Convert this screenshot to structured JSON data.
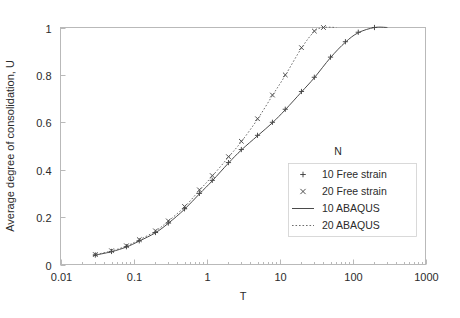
{
  "chart_data": {
    "type": "line",
    "title": "",
    "xlabel": "T",
    "ylabel": "Average degree of consolidation, U",
    "xscale": "log",
    "xlim": [
      0.01,
      1000
    ],
    "ylim": [
      0,
      1
    ],
    "xticks": [
      "0.01",
      "0.1",
      "1",
      "10",
      "100",
      "1000"
    ],
    "xtick_values": [
      0.01,
      0.1,
      1,
      10,
      100,
      1000
    ],
    "yticks": [
      "0",
      "0.2",
      "0.4",
      "0.6",
      "0.8",
      "1"
    ],
    "ytick_values": [
      0,
      0.2,
      0.4,
      0.6,
      0.8,
      1
    ],
    "grid": false,
    "y_inverted": false,
    "legend_position": "inside-right",
    "legend_title": "N",
    "series": [
      {
        "name": "10 Free strain",
        "marker": "plus",
        "line": "none",
        "color": "#3a3a3a",
        "x": [
          0.03,
          0.05,
          0.08,
          0.12,
          0.2,
          0.3,
          0.5,
          0.8,
          1.2,
          2.0,
          3.0,
          5.0,
          8.0,
          12.0,
          20.0,
          30.0,
          50.0,
          80.0,
          120.0,
          200.0
        ],
        "y": [
          0.04,
          0.055,
          0.075,
          0.1,
          0.135,
          0.175,
          0.235,
          0.3,
          0.355,
          0.43,
          0.485,
          0.545,
          0.6,
          0.655,
          0.73,
          0.79,
          0.875,
          0.94,
          0.98,
          1.0
        ]
      },
      {
        "name": "20 Free strain",
        "marker": "cross",
        "line": "none",
        "color": "#3a3a3a",
        "x": [
          0.03,
          0.05,
          0.08,
          0.12,
          0.2,
          0.3,
          0.5,
          0.8,
          1.2,
          2.0,
          3.0,
          5.0,
          8.0,
          12.0,
          20.0,
          30.0,
          40.0
        ],
        "y": [
          0.042,
          0.058,
          0.079,
          0.105,
          0.142,
          0.184,
          0.245,
          0.315,
          0.375,
          0.455,
          0.52,
          0.615,
          0.715,
          0.8,
          0.915,
          0.985,
          1.0
        ]
      },
      {
        "name": "10 ABAQUS",
        "marker": "none",
        "line": "solid",
        "color": "#4a4a4a",
        "x": [
          0.028,
          0.05,
          0.08,
          0.12,
          0.2,
          0.3,
          0.5,
          0.8,
          1.2,
          2.0,
          3.0,
          5.0,
          8.0,
          12.0,
          20.0,
          30.0,
          50.0,
          80.0,
          120.0,
          200.0,
          300.0
        ],
        "y": [
          0.038,
          0.054,
          0.074,
          0.099,
          0.134,
          0.174,
          0.233,
          0.298,
          0.353,
          0.428,
          0.483,
          0.543,
          0.598,
          0.653,
          0.728,
          0.788,
          0.873,
          0.938,
          0.978,
          1.0,
          1.0
        ]
      },
      {
        "name": "20 ABAQUS",
        "marker": "none",
        "line": "dotted",
        "color": "#6e6e6e",
        "x": [
          0.028,
          0.05,
          0.08,
          0.12,
          0.2,
          0.3,
          0.5,
          0.8,
          1.2,
          2.0,
          3.0,
          5.0,
          8.0,
          12.0,
          20.0,
          30.0,
          40.0,
          60.0
        ],
        "y": [
          0.04,
          0.057,
          0.078,
          0.104,
          0.141,
          0.183,
          0.243,
          0.313,
          0.373,
          0.453,
          0.518,
          0.613,
          0.713,
          0.798,
          0.913,
          0.983,
          1.0,
          1.0
        ]
      }
    ],
    "legend_entries": [
      {
        "label": "10 Free strain",
        "symbol": "plus"
      },
      {
        "label": "20 Free strain",
        "symbol": "cross"
      },
      {
        "label": "10 ABAQUS",
        "symbol": "solid-line"
      },
      {
        "label": "20 ABAQUS",
        "symbol": "dotted-line"
      }
    ]
  }
}
